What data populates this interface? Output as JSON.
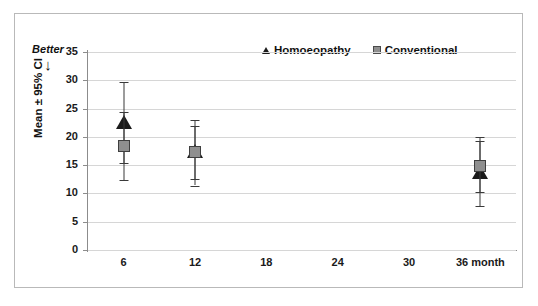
{
  "chart_data": {
    "type": "scatter",
    "title": "",
    "xlabel": "",
    "ylabel": "Mean ± 95% CI",
    "ylim": [
      0,
      35
    ],
    "yticks": [
      0,
      5,
      10,
      15,
      20,
      25,
      30,
      35
    ],
    "grid": true,
    "legend_position": "top-center",
    "categories": [
      "6",
      "12",
      "18",
      "24",
      "30",
      "36 month"
    ],
    "x": [
      6,
      12,
      36
    ],
    "annotations": [
      {
        "text": "Better",
        "arrow": "↓",
        "position": "top-left-outside-axis"
      }
    ],
    "series": [
      {
        "name": "Homoeopathy",
        "marker": "triangle",
        "color": "#1b1b1b",
        "x": [
          6,
          12,
          36
        ],
        "values": [
          22.2,
          17.2,
          13.5
        ],
        "ci_lower": [
          15.3,
          11.4,
          7.8
        ],
        "ci_upper": [
          29.7,
          23.0,
          19.2
        ]
      },
      {
        "name": "Conventional",
        "marker": "square",
        "color": "#8f8f8f",
        "x": [
          6,
          12,
          36
        ],
        "values": [
          18.3,
          17.3,
          14.8
        ],
        "ci_lower": [
          12.3,
          12.6,
          10.2
        ],
        "ci_upper": [
          24.4,
          22.0,
          20.0
        ]
      }
    ]
  },
  "legend": {
    "items": [
      {
        "label": "Homoeopathy",
        "marker": "triangle-icon"
      },
      {
        "label": "Conventional",
        "marker": "square-icon"
      }
    ]
  },
  "axes": {
    "y_title": "Mean ± 95% CI",
    "y_tick_labels": [
      "35",
      "30",
      "25",
      "20",
      "15",
      "10",
      "5",
      "0"
    ],
    "x_tick_labels": [
      "6",
      "12",
      "18",
      "24",
      "30",
      "36 month"
    ]
  },
  "annotation": {
    "better_label": "Better",
    "better_arrow": "↓"
  },
  "colors": {
    "homoeopathy": "#1b1b1b",
    "conventional": "#8f8f8f",
    "gridline": "#d6d6d6",
    "axis": "#8c8c8c",
    "frame": "#b9b9b9"
  }
}
